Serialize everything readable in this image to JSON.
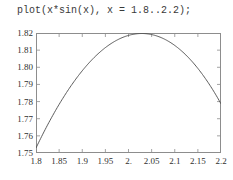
{
  "command": {
    "text": "plot(x*sin(x), x = 1.8..2.2);"
  },
  "colors": {
    "background": "#ffffff",
    "frame": "#8d8d8d",
    "curve": "#4a4a4a",
    "text": "#2f2f2f"
  },
  "chart_data": {
    "type": "line",
    "title": "plot(x*sin(x), x = 1.8..2.2);",
    "xlabel": "",
    "ylabel": "",
    "expression": "x*sin(x)",
    "xlim": [
      1.8,
      2.2
    ],
    "ylim": [
      1.75,
      1.82
    ],
    "grid": false,
    "legend": false,
    "x_ticks": [
      1.8,
      1.85,
      1.9,
      1.95,
      2.0,
      2.05,
      2.1,
      2.15,
      2.2
    ],
    "x_tick_labels": [
      "1.8",
      "1.85",
      "1.9",
      "1.95",
      "2.",
      "2.05",
      "2.1",
      "2.15",
      "2.2"
    ],
    "y_ticks": [
      1.75,
      1.76,
      1.77,
      1.78,
      1.79,
      1.8,
      1.81,
      1.82
    ],
    "y_tick_labels": [
      "1.75",
      "1.76",
      "1.77",
      "1.78",
      "1.79",
      "1.80",
      "1.81",
      "1.82"
    ],
    "series": [
      {
        "name": "x*sin(x)",
        "x": [
          1.8,
          1.82,
          1.84,
          1.86,
          1.88,
          1.9,
          1.92,
          1.94,
          1.96,
          1.98,
          2.0,
          2.02,
          2.04,
          2.06,
          2.08,
          2.1,
          2.12,
          2.14,
          2.16,
          2.18,
          2.2
        ],
        "y": [
          1.7527,
          1.7613,
          1.7689,
          1.7757,
          1.7815,
          1.7865,
          1.7906,
          1.7938,
          1.7962,
          1.7977,
          1.7985,
          1.7984,
          1.7975,
          1.7958,
          1.7933,
          1.79,
          1.786,
          1.7812,
          1.7756,
          1.7694,
          1.7624
        ]
      }
    ]
  }
}
